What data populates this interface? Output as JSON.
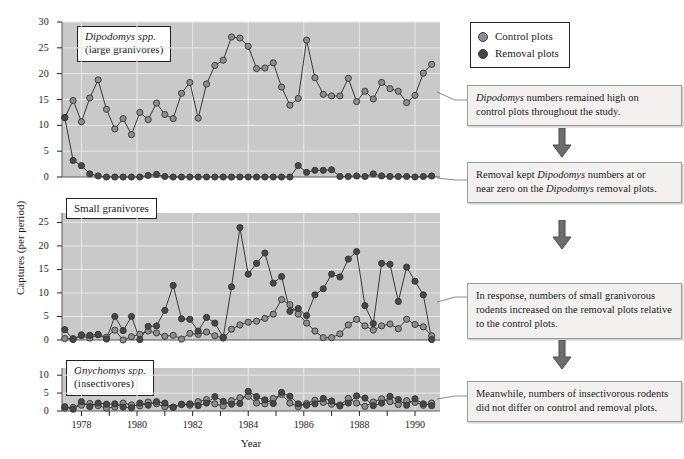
{
  "axes": {
    "ylabel": "Captures (per period)",
    "xlabel": "Year",
    "xticklabels": [
      "1978",
      "1980",
      "1982",
      "1984",
      "1986",
      "1988",
      "1990"
    ]
  },
  "legend": {
    "items": [
      {
        "label": "Control plots",
        "marker": "control-dot",
        "color": "#8d8d8d"
      },
      {
        "label": "Removal plots",
        "marker": "removal-dot",
        "color": "#474747"
      }
    ]
  },
  "panels": [
    {
      "id": "dipodomys",
      "caption_line1": "Dipodomys spp.",
      "caption_line2": "(large granivores)",
      "caption_italic_first": true,
      "yticks": [
        "0",
        "5",
        "10",
        "15",
        "20",
        "25",
        "30"
      ]
    },
    {
      "id": "small-granivores",
      "caption_line1": "Small granivores",
      "caption_line2": "",
      "caption_italic_first": false,
      "yticks": [
        "0",
        "5",
        "10",
        "15",
        "20",
        "25"
      ]
    },
    {
      "id": "onychomys",
      "caption_line1": "Onychomys spp.",
      "caption_line2": "(insectivores)",
      "caption_italic_first": true,
      "yticks": [
        "0",
        "5",
        "10"
      ]
    }
  ],
  "annotations": [
    {
      "id": "anno-1",
      "lines": [
        "Dipodomys numbers remained high on",
        "control plots throughout the study."
      ],
      "italic_lead": "Dipodomys"
    },
    {
      "id": "anno-2",
      "lines": [
        "Removal kept Dipodomys numbers at or",
        "near zero on the Dipodomys removal plots."
      ],
      "italic_lead": "Dipodomys"
    },
    {
      "id": "anno-3",
      "lines": [
        "In response, numbers of small granivorous",
        "rodents increased on the removal plots relative",
        "to the control plots."
      ],
      "italic_lead": ""
    },
    {
      "id": "anno-4",
      "lines": [
        "Meanwhile, numbers of insectivorous rodents",
        "did not differ on control and removal plots."
      ],
      "italic_lead": ""
    }
  ],
  "chart_data": {
    "type": "line",
    "title": "",
    "xlabel": "Year",
    "ylabel": "Captures (per period)",
    "xlim": [
      1977.3,
      1990.9
    ],
    "grid": true,
    "legend_position": "top-right",
    "panels": [
      {
        "name": "Dipodomys spp. (large granivores)",
        "ylim": [
          0,
          30
        ],
        "yticks": [
          0,
          5,
          10,
          15,
          20,
          25,
          30
        ],
        "series": [
          {
            "name": "Control plots",
            "color": "#8d8d8d",
            "x": [
              1977.4,
              1977.7,
              1978.0,
              1978.3,
              1978.6,
              1978.9,
              1979.2,
              1979.5,
              1979.8,
              1980.1,
              1980.4,
              1980.7,
              1981.0,
              1981.3,
              1981.6,
              1981.9,
              1982.2,
              1982.5,
              1982.8,
              1983.1,
              1983.4,
              1983.7,
              1984.0,
              1984.3,
              1984.6,
              1984.9,
              1985.2,
              1985.5,
              1985.8,
              1986.1,
              1986.4,
              1986.7,
              1987.0,
              1987.3,
              1987.6,
              1987.9,
              1988.2,
              1988.5,
              1988.8,
              1989.1,
              1989.4,
              1989.7,
              1990.0,
              1990.3,
              1990.6
            ],
            "values": [
              11.5,
              14.8,
              10.7,
              15.3,
              18.8,
              13.1,
              9.3,
              11.3,
              8.2,
              12.5,
              11.1,
              14.3,
              12.1,
              11.3,
              16.2,
              18.3,
              11.4,
              18.0,
              21.6,
              22.6,
              27.1,
              26.9,
              25.3,
              21.0,
              21.1,
              22.1,
              17.4,
              13.9,
              15.2,
              26.5,
              19.2,
              16.0,
              15.7,
              15.7,
              19.1,
              14.6,
              16.6,
              15.1,
              18.3,
              17.1,
              16.6,
              14.4,
              15.8,
              20.1,
              21.8
            ]
          },
          {
            "name": "Removal plots",
            "color": "#474747",
            "x": [
              1977.4,
              1977.7,
              1978.0,
              1978.3,
              1978.6,
              1978.9,
              1979.2,
              1979.5,
              1979.8,
              1980.1,
              1980.4,
              1980.7,
              1981.0,
              1981.3,
              1981.6,
              1981.9,
              1982.2,
              1982.5,
              1982.8,
              1983.1,
              1983.4,
              1983.7,
              1984.0,
              1984.3,
              1984.6,
              1984.9,
              1985.2,
              1985.5,
              1985.8,
              1986.1,
              1986.4,
              1986.7,
              1987.0,
              1987.3,
              1987.6,
              1987.9,
              1988.2,
              1988.5,
              1988.8,
              1989.1,
              1989.4,
              1989.7,
              1990.0,
              1990.3,
              1990.6
            ],
            "values": [
              11.5,
              3.2,
              2.2,
              0.6,
              0.2,
              0.0,
              0.0,
              0.0,
              0.0,
              0.0,
              0.3,
              0.5,
              0.1,
              0.0,
              0.0,
              0.0,
              0.0,
              0.0,
              0.0,
              0.0,
              0.0,
              0.0,
              0.0,
              0.0,
              0.0,
              0.0,
              0.0,
              0.0,
              2.2,
              0.9,
              1.3,
              1.3,
              1.4,
              0.1,
              0.1,
              0.2,
              0.1,
              0.6,
              0.2,
              0.1,
              0.1,
              0.1,
              0.0,
              0.1,
              0.2
            ]
          }
        ]
      },
      {
        "name": "Small granivores",
        "ylim": [
          0,
          27
        ],
        "yticks": [
          0,
          5,
          10,
          15,
          20,
          25
        ],
        "series": [
          {
            "name": "Control plots",
            "color": "#8d8d8d",
            "x": [
              1977.4,
              1977.7,
              1978.0,
              1978.3,
              1978.6,
              1978.9,
              1979.2,
              1979.5,
              1979.8,
              1980.1,
              1980.4,
              1980.7,
              1981.0,
              1981.3,
              1981.6,
              1981.9,
              1982.2,
              1982.5,
              1982.8,
              1983.1,
              1983.4,
              1983.7,
              1984.0,
              1984.3,
              1984.6,
              1984.9,
              1985.2,
              1985.5,
              1985.8,
              1986.1,
              1986.4,
              1986.7,
              1987.0,
              1987.3,
              1987.6,
              1987.9,
              1988.2,
              1988.5,
              1988.8,
              1989.1,
              1989.4,
              1989.7,
              1990.0,
              1990.3,
              1990.6
            ],
            "values": [
              0.3,
              0.3,
              0.9,
              0.4,
              1.1,
              0.6,
              2.1,
              0.0,
              0.7,
              1.2,
              1.9,
              1.5,
              0.8,
              1.0,
              0.2,
              1.4,
              1.2,
              1.7,
              0.9,
              0.4,
              2.3,
              3.2,
              3.8,
              4.0,
              4.6,
              5.5,
              8.6,
              7.5,
              5.5,
              3.6,
              1.9,
              0.5,
              0.5,
              1.3,
              3.2,
              4.4,
              3.0,
              2.1,
              3.0,
              3.4,
              2.4,
              4.4,
              3.3,
              2.8,
              0.9
            ]
          },
          {
            "name": "Removal plots",
            "color": "#474747",
            "x": [
              1977.4,
              1977.7,
              1978.0,
              1978.3,
              1978.6,
              1978.9,
              1979.2,
              1979.5,
              1979.8,
              1980.1,
              1980.4,
              1980.7,
              1981.0,
              1981.3,
              1981.6,
              1981.9,
              1982.2,
              1982.5,
              1982.8,
              1983.1,
              1983.4,
              1983.7,
              1984.0,
              1984.3,
              1984.6,
              1984.9,
              1985.2,
              1985.5,
              1985.8,
              1986.1,
              1986.4,
              1986.7,
              1987.0,
              1987.3,
              1987.6,
              1987.9,
              1988.2,
              1988.5,
              1988.8,
              1989.1,
              1989.4,
              1989.7,
              1990.0,
              1990.3,
              1990.6
            ],
            "values": [
              2.2,
              0.1,
              1.1,
              1.0,
              1.2,
              0.2,
              5.0,
              2.0,
              5.0,
              0.1,
              2.9,
              3.0,
              6.3,
              11.6,
              4.5,
              4.4,
              1.9,
              4.8,
              3.6,
              0.6,
              11.3,
              23.9,
              14.0,
              16.3,
              18.5,
              12.1,
              13.5,
              6.1,
              6.7,
              5.2,
              9.6,
              10.9,
              14.0,
              13.4,
              17.2,
              18.8,
              7.3,
              3.5,
              16.3,
              16.1,
              8.2,
              15.5,
              12.5,
              9.6,
              0.1
            ]
          }
        ]
      },
      {
        "name": "Onychomys spp. (insectivores)",
        "ylim": [
          0,
          12
        ],
        "yticks": [
          0,
          5,
          10
        ],
        "series": [
          {
            "name": "Control plots",
            "color": "#8d8d8d",
            "x": [
              1977.4,
              1977.7,
              1978.0,
              1978.3,
              1978.6,
              1978.9,
              1979.2,
              1979.5,
              1979.8,
              1980.1,
              1980.4,
              1980.7,
              1981.0,
              1981.3,
              1981.6,
              1981.9,
              1982.2,
              1982.5,
              1982.8,
              1983.1,
              1983.4,
              1983.7,
              1984.0,
              1984.3,
              1984.6,
              1984.9,
              1985.2,
              1985.5,
              1985.8,
              1986.1,
              1986.4,
              1986.7,
              1987.0,
              1987.3,
              1987.6,
              1987.9,
              1988.2,
              1988.5,
              1988.8,
              1989.1,
              1989.4,
              1989.7,
              1990.0,
              1990.3,
              1990.6
            ],
            "values": [
              0.8,
              1.0,
              1.6,
              2.1,
              1.5,
              0.8,
              1.1,
              2.2,
              1.7,
              1.4,
              2.5,
              2.0,
              1.2,
              1.1,
              1.9,
              1.6,
              2.6,
              3.2,
              2.0,
              1.4,
              2.9,
              3.7,
              4.1,
              2.2,
              2.0,
              3.5,
              4.6,
              2.2,
              1.2,
              2.1,
              3.0,
              2.4,
              1.9,
              1.7,
              3.5,
              2.2,
              1.3,
              2.5,
              3.4,
              2.6,
              1.8,
              2.9,
              2.4,
              1.6,
              2.2
            ]
          },
          {
            "name": "Removal plots",
            "color": "#474747",
            "x": [
              1977.4,
              1977.7,
              1978.0,
              1978.3,
              1978.6,
              1978.9,
              1979.2,
              1979.5,
              1979.8,
              1980.1,
              1980.4,
              1980.7,
              1981.0,
              1981.3,
              1981.6,
              1981.9,
              1982.2,
              1982.5,
              1982.8,
              1983.1,
              1983.4,
              1983.7,
              1984.0,
              1984.3,
              1984.6,
              1984.9,
              1985.2,
              1985.5,
              1985.8,
              1986.1,
              1986.4,
              1986.7,
              1987.0,
              1987.3,
              1987.6,
              1987.9,
              1988.2,
              1988.5,
              1988.8,
              1989.1,
              1989.4,
              1989.7,
              1990.0,
              1990.3,
              1990.6
            ],
            "values": [
              1.2,
              0.5,
              2.6,
              1.2,
              2.2,
              1.9,
              2.0,
              1.1,
              0.9,
              2.2,
              1.6,
              2.6,
              2.2,
              1.0,
              1.8,
              2.0,
              1.5,
              2.2,
              4.0,
              2.7,
              1.9,
              2.1,
              5.5,
              4.0,
              3.1,
              2.1,
              5.2,
              4.1,
              2.0,
              1.6,
              2.0,
              3.5,
              2.8,
              1.4,
              2.2,
              4.2,
              3.6,
              1.5,
              2.2,
              4.1,
              3.2,
              1.6,
              3.4,
              2.0,
              1.5
            ]
          }
        ]
      }
    ]
  }
}
